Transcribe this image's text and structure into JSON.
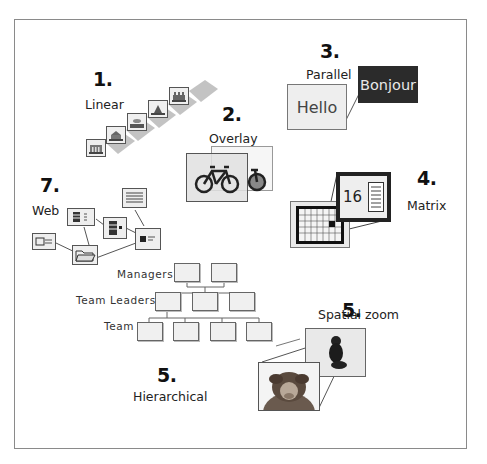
{
  "diagram": {
    "type": "navigation-patterns-overview",
    "sections": [
      {
        "number": "1.",
        "label": "Linear"
      },
      {
        "number": "2.",
        "label": "Overlay"
      },
      {
        "number": "3.",
        "label": "Parallel",
        "items": [
          "Hello",
          "Bonjour"
        ]
      },
      {
        "number": "4.",
        "label": "Matrix",
        "zoom_value": "16"
      },
      {
        "number": "5.",
        "label": "Spatial zoom"
      },
      {
        "number": "6.",
        "label": "Hierarchical",
        "levels": [
          "Managers",
          "Team Leaders",
          "Team"
        ]
      },
      {
        "number": "7.",
        "label": "Web"
      }
    ],
    "colors": {
      "frame": "#8a8a8a",
      "dark_panel": "#2b2b2b",
      "light_panel": "#eeeeee",
      "text": "#222222"
    }
  }
}
